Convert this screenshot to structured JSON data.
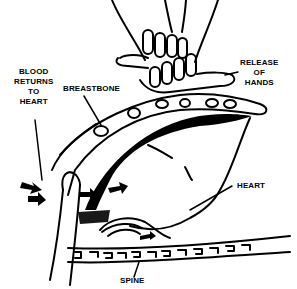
{
  "diagram": {
    "colors": {
      "ink": "#000000",
      "paper": "#ffffff"
    },
    "labels": {
      "blood_returns": [
        "BLOOD",
        "RETURNS",
        "TO",
        "HEART"
      ],
      "breastbone": "BREASTBONE",
      "release": [
        "RELEASE",
        "OF",
        "HANDS"
      ],
      "heart": "HEART",
      "spine": "SPINE"
    }
  }
}
